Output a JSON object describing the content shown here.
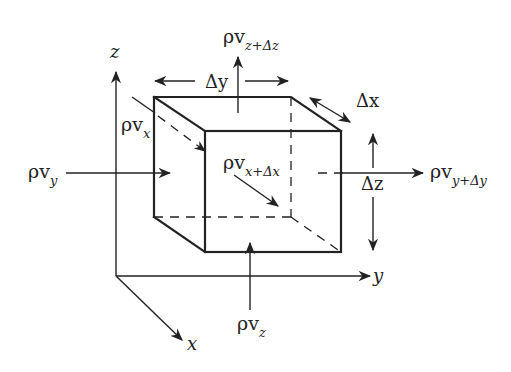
{
  "diagram": {
    "axes": {
      "x_label": "x",
      "y_label": "y",
      "z_label": "z"
    },
    "dimensions": {
      "dx": "Δx",
      "dy": "Δy",
      "dz": "Δz"
    },
    "fluxes": {
      "in_x": {
        "main": "ρv",
        "sub": "x"
      },
      "out_x": {
        "main": "ρv",
        "sub": "x+Δx"
      },
      "in_y": {
        "main": "ρv",
        "sub": "y"
      },
      "out_y": {
        "main": "ρv",
        "sub": "y+Δy"
      },
      "in_z": {
        "main": "ρv",
        "sub": "z"
      },
      "out_z": {
        "main": "ρv",
        "sub": "z+Δz"
      }
    },
    "colors": {
      "ink": "#222222",
      "background": "#ffffff"
    }
  }
}
